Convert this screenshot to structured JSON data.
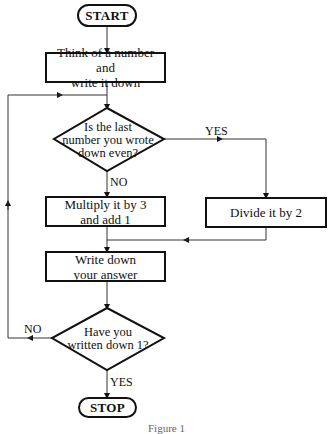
{
  "flowchart": {
    "start": "START",
    "stop": "STOP",
    "step_think": {
      "line1": "Think of a number and",
      "line2": "write it down"
    },
    "decision_even": {
      "line1": "Is the last",
      "line2": "number you wrote",
      "line3": "down even?"
    },
    "step_multiply": {
      "line1": "Multiply it by 3",
      "line2": "and add 1"
    },
    "step_divide": "Divide it by 2",
    "step_write": {
      "line1": "Write down",
      "line2": "your answer"
    },
    "decision_one": {
      "line1": "Have you",
      "line2": "written down 1?"
    },
    "edge_labels": {
      "even_yes": "YES",
      "even_no": "NO",
      "one_no": "NO",
      "one_yes": "YES"
    }
  },
  "caption": "Figure 1"
}
